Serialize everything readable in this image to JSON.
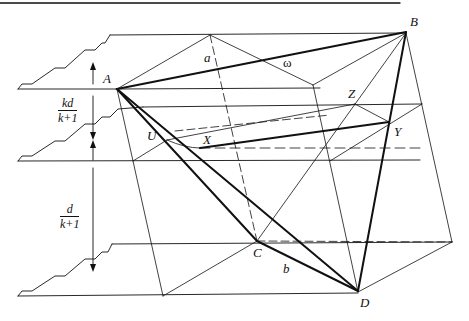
{
  "figure": {
    "type": "geometric-diagram"
  },
  "points": {
    "A": "A",
    "B": "B",
    "C": "C",
    "D": "D",
    "U": "U",
    "X": "X",
    "Y": "Y",
    "Z": "Z"
  },
  "edge_labels": {
    "a": "a",
    "b": "b",
    "omega": "ω"
  },
  "distances": {
    "upper": {
      "numerator": "kd",
      "denominator": "k+1"
    },
    "lower": {
      "numerator": "d",
      "denominator": "k+1"
    }
  },
  "colors": {
    "line": "#111111",
    "background": "#ffffff"
  }
}
